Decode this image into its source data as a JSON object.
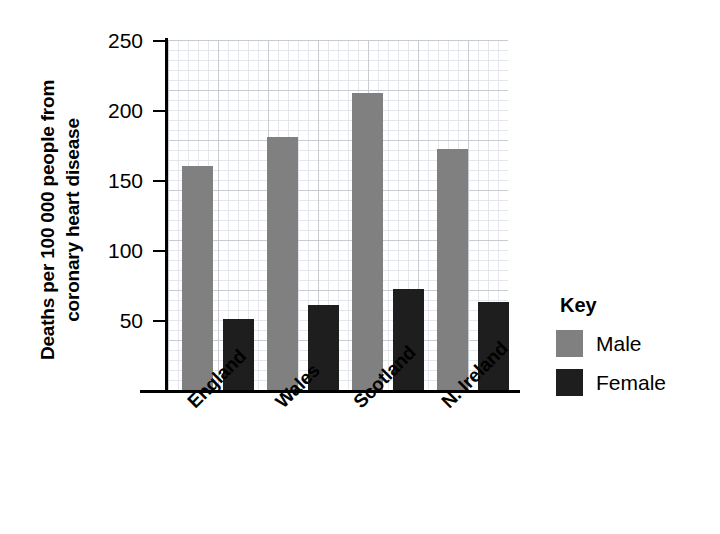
{
  "chart_data": {
    "type": "bar",
    "title": "",
    "xlabel": "",
    "ylabel": "Deaths per 100 000 people from coronary heart disease",
    "ylabel_lines": [
      "Deaths per 100 000 people from",
      "coronary heart disease"
    ],
    "categories": [
      "England",
      "Wales",
      "Scotland",
      "N. Ireland"
    ],
    "series": [
      {
        "name": "Male",
        "color": "#808080",
        "values": [
          160,
          181,
          212,
          172
        ]
      },
      {
        "name": "Female",
        "color": "#1e1e1e",
        "values": [
          51,
          61,
          72,
          63
        ]
      }
    ],
    "ylim": [
      0,
      250
    ],
    "y_ticks": [
      250,
      200,
      150,
      100,
      50
    ],
    "y_tick_labels": [
      "250",
      "200",
      "150",
      "100",
      "50"
    ],
    "y_tick_interval": 50,
    "grid": true,
    "grid_minor_interval": 10,
    "legend_position": "right",
    "legend_title": "Key"
  },
  "legend": {
    "title": "Key",
    "entries": [
      {
        "label": "Male",
        "color": "#808080"
      },
      {
        "label": "Female",
        "color": "#1e1e1e"
      }
    ]
  },
  "colors": {
    "male": "#808080",
    "female": "#1e1e1e",
    "axis": "#000000",
    "grid_major": "#c8ccd2",
    "grid_minor": "#e3e6ea",
    "background": "#ffffff"
  }
}
